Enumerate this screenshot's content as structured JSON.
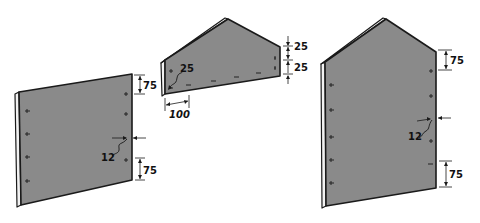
{
  "diagram": {
    "colors": {
      "panel": "#8a8a8a",
      "edge": "#f2f2f2",
      "ink": "#1a1a1a"
    },
    "panels": [
      {
        "id": "side-panel-left",
        "label_values": {
          "top_spacing": "75",
          "bottom_spacing": "75",
          "edge_inset": "12"
        },
        "screws_left": 4,
        "screws_right": 4
      },
      {
        "id": "gable-panel-middle",
        "label_values": {
          "corner_inset": "25",
          "top_spacing": "25",
          "bottom_spacing": "25",
          "horizontal_offset": "100"
        },
        "screws_bottom": 6
      },
      {
        "id": "gable-panel-right",
        "label_values": {
          "top_spacing": "75",
          "bottom_spacing": "75",
          "edge_inset": "12"
        },
        "screws_left": 5,
        "screws_right": 5
      }
    ]
  },
  "labels": {
    "left_top": "75",
    "left_bottom": "75",
    "left_inset": "12",
    "mid_inset": "25",
    "mid_top": "25",
    "mid_bottom": "25",
    "mid_width": "100",
    "right_top": "75",
    "right_bottom": "75",
    "right_inset": "12"
  }
}
